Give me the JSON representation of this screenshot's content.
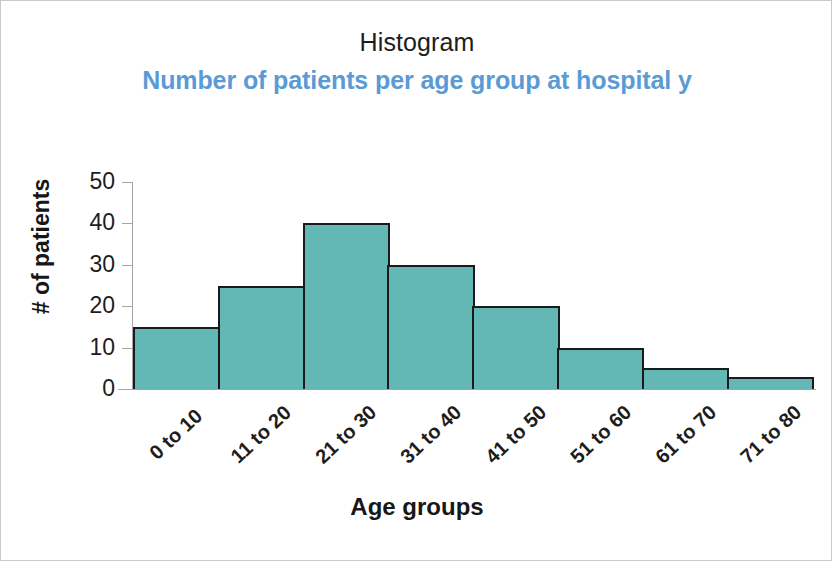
{
  "chart_data": {
    "type": "bar",
    "title": "Histogram",
    "subtitle": "Number of patients per age group at hospital y",
    "xlabel": "Age groups",
    "ylabel": "# of patients",
    "categories": [
      "0 to 10",
      "11 to 20",
      "21 to 30",
      "31 to 40",
      "41 to 50",
      "51 to 60",
      "61 to 70",
      "71 to 80"
    ],
    "values": [
      15,
      25,
      40,
      30,
      20,
      10,
      5,
      3
    ],
    "ylim": [
      0,
      50
    ],
    "yticks": [
      0,
      10,
      20,
      30,
      40,
      50
    ],
    "ytick_labels": [
      "0",
      "10",
      "20",
      "30",
      "40",
      "50"
    ],
    "grid": false,
    "legend": false,
    "bar_fill_color": "#63b7b5",
    "bar_border_color": "#1a1a1a",
    "subtitle_color": "#5b9bd5",
    "title_color": "#1d1d1d",
    "axis_color": "#a6a6a6",
    "bar_gap": 0
  }
}
